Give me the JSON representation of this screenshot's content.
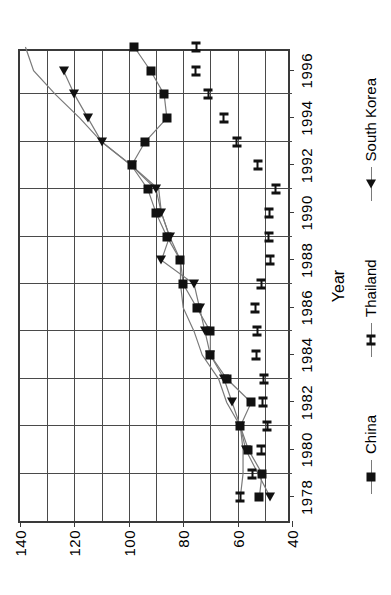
{
  "chart_data": {
    "type": "line",
    "title": "",
    "xlabel": "Year",
    "ylabel": "",
    "xlim": [
      1977,
      1997
    ],
    "ylim": [
      40,
      140
    ],
    "xticks": [
      1978,
      1980,
      1982,
      1984,
      1986,
      1988,
      1990,
      1992,
      1994,
      1996
    ],
    "yticks": [
      40,
      60,
      80,
      100,
      120,
      140
    ],
    "gridlines_y": [
      50,
      60,
      70,
      80,
      90,
      100,
      110,
      120,
      130
    ],
    "grid": true,
    "legend_position": "bottom",
    "x": [
      1978,
      1979,
      1980,
      1981,
      1982,
      1983,
      1984,
      1985,
      1986,
      1987,
      1988,
      1989,
      1990,
      1991,
      1992,
      1993,
      1994,
      1995,
      1996,
      1997
    ],
    "series": [
      {
        "name": "China",
        "marker": "square",
        "values": [
          52,
          51,
          56,
          59,
          55,
          64,
          70,
          70,
          75,
          80,
          81,
          86,
          90,
          93,
          99,
          94,
          86,
          87,
          92,
          98
        ]
      },
      {
        "name": "Thailand",
        "marker": "x",
        "values": [
          59,
          58,
          58,
          59,
          64,
          67,
          73,
          76,
          80,
          81,
          81,
          85,
          88,
          89,
          99,
          110,
          118,
          127,
          135,
          138
        ]
      },
      {
        "name": "South Korea",
        "marker": "triangle",
        "values": [
          48,
          null,
          57,
          59,
          62,
          65,
          70,
          72,
          74,
          76,
          88,
          85,
          88,
          90,
          99,
          110,
          115,
          120,
          124,
          null
        ]
      }
    ]
  },
  "axis": {
    "x_title": "Year",
    "y_tick_labels": [
      "40",
      "60",
      "80",
      "100",
      "120",
      "140"
    ],
    "x_tick_labels": [
      "1978",
      "1980",
      "1982",
      "1984",
      "1986",
      "1988",
      "1990",
      "1992",
      "1994",
      "1996"
    ]
  },
  "legend": {
    "items": [
      {
        "label": "China",
        "marker": "square-marker"
      },
      {
        "label": "Thailand",
        "marker": "x-marker"
      },
      {
        "label": "South Korea",
        "marker": "triangle-marker"
      }
    ]
  },
  "colors": {
    "line": "#7a7a7a",
    "marker": "#111111",
    "axis": "#3a3a3a",
    "grid": "#4a4a4a",
    "background": "#ffffff"
  }
}
